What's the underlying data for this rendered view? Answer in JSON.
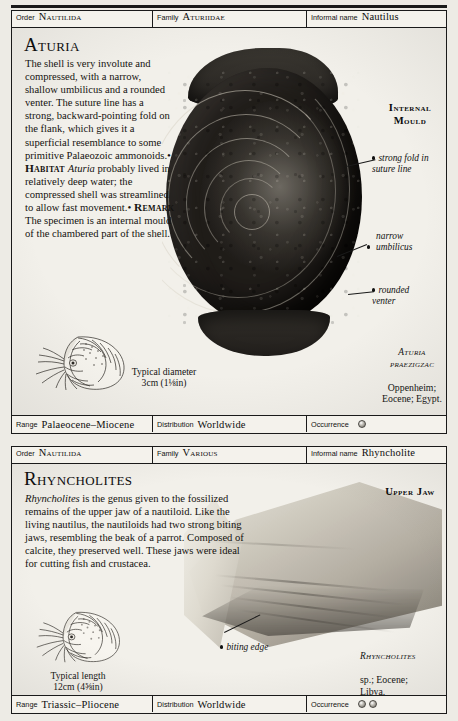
{
  "page": {
    "background_color": "#edebe5",
    "panel_background": "#f2f0ea",
    "rule_color": "#1a1a1a"
  },
  "field_labels": {
    "order": "Order",
    "family": "Family",
    "informal_name": "Informal name",
    "range": "Range",
    "distribution": "Distribution",
    "occurrence": "Occurrence"
  },
  "entries": [
    {
      "header": {
        "order": "Nautilida",
        "family": "Aturiidae",
        "informal_name": "Nautilus"
      },
      "title": "Aturia",
      "description_runs": [
        {
          "text": "The shell is very involute and compressed, with a narrow, shallow umbilicus and a rounded venter. The suture line has a strong, backward-pointing fold on the flank, which gives it a superficial resemblance to some primitive Palaeozoic ammonoids.",
          "style": "normal"
        },
        {
          "text": "• ",
          "style": "bullet"
        },
        {
          "text": "Habitat ",
          "style": "smallcaps-bold"
        },
        {
          "text": "Aturia",
          "style": "italic"
        },
        {
          "text": " probably lived in relatively deep water; the compressed shell was streamlined to allow fast movement.",
          "style": "normal"
        },
        {
          "text": "• ",
          "style": "bullet"
        },
        {
          "text": "Remark ",
          "style": "smallcaps-bold"
        },
        {
          "text": "The specimen is an internal mould of the chambered part of the shell.",
          "style": "normal"
        }
      ],
      "callouts": [
        {
          "name": "internal-mould",
          "text": "Internal\nMould",
          "kind": "caps"
        },
        {
          "name": "strong-fold-in-suture-line",
          "text": "strong fold in\nsuture line",
          "kind": "italic-dot"
        },
        {
          "name": "narrow-umbilicus",
          "text": "narrow\numbilicus",
          "kind": "italic-dot"
        },
        {
          "name": "rounded-venter",
          "text": "rounded\nventer",
          "kind": "italic-dot"
        }
      ],
      "specimen_caption": {
        "species": "Aturia\npraezigzac",
        "details": "Oppenheim;\nEocene; Egypt."
      },
      "scale_caption": "Typical diameter\n3cm (1⅛in)",
      "footer": {
        "range": "Palaeocene–Miocene",
        "distribution": "Worldwide",
        "occurrence_count": 1
      }
    },
    {
      "header": {
        "order": "Nautilida",
        "family": "Various",
        "informal_name": "Rhyncholite"
      },
      "title": "Rhyncholites",
      "description_runs": [
        {
          "text": "Rhyncholites",
          "style": "italic"
        },
        {
          "text": " is the genus given to the fossilized remains of the upper jaw of a nautiloid. Like the living nautilus, the nautiloids had two strong biting jaws, resembling the beak of a parrot. Composed of calcite, they preserved well. These jaws were ideal for cutting fish and crustacea.",
          "style": "normal"
        }
      ],
      "callouts": [
        {
          "name": "upper-jaw",
          "text": "Upper Jaw",
          "kind": "caps"
        },
        {
          "name": "biting-edge",
          "text": "biting edge",
          "kind": "italic-dot"
        }
      ],
      "specimen_caption": {
        "species": "Rhyncholites",
        "details": "sp.; Eocene;\nLibya."
      },
      "scale_caption": "Typical length\n12cm (4⅝in)",
      "footer": {
        "range": "Triassic–Pliocene",
        "distribution": "Worldwide",
        "occurrence_count": 2
      }
    }
  ],
  "icons": {
    "occurrence_dot": "occurrence-dot-icon",
    "nautilus_drawing": "nautilus-line-drawing-icon",
    "leader_dot": "leader-dot-icon"
  }
}
